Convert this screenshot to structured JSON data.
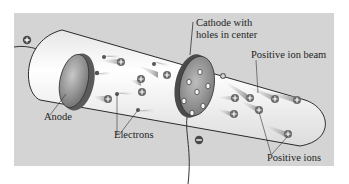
{
  "figure": {
    "labels": {
      "cathode": "Cathode with\nholes in center",
      "cathode_line1": "Cathode with",
      "cathode_line2": "holes in center",
      "positive_ion_beam": "Positive ion beam",
      "anode": "Anode",
      "electrons": "Electrons",
      "positive_ions": "Positive ions"
    },
    "terminals": {
      "anode_sign": "+",
      "cathode_sign": "−"
    },
    "colors": {
      "background_panel": "#d4d4d4",
      "tube_fill": "#f4f4f4",
      "tube_outline": "#2a2a2a",
      "electrode_gray": "#8a8a8a",
      "ion_streak": "#9a9a9a",
      "label_text": "#1e1e1e"
    }
  }
}
